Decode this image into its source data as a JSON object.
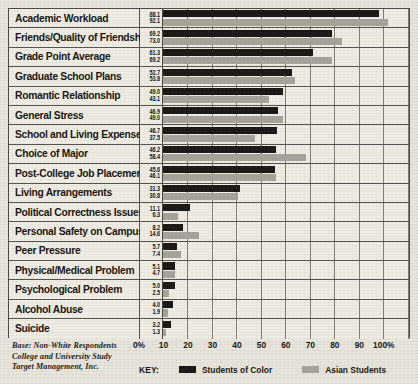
{
  "chart_data": {
    "type": "bar",
    "orientation": "horizontal",
    "title": "",
    "xlabel": "",
    "ylabel": "",
    "xlim": [
      0,
      100
    ],
    "grid": true,
    "legend_position": "bottom",
    "categories": [
      "Academic Workload",
      "Friends/Quality of Friendships",
      "Grade Point Average",
      "Graduate School Plans",
      "Romantic Relationship",
      "General Stress",
      "School and Living Expenses",
      "Choice of Major",
      "Post-College Job Placement",
      "Living Arrangements",
      "Political Correctness Issues",
      "Personal Safety on Campus",
      "Peer Pressure",
      "Physical/Medical Problem",
      "Psychological Problem",
      "Alcohol Abuse",
      "Suicide"
    ],
    "series": [
      {
        "name": "Students of Color",
        "color": "#1a1814",
        "values": [
          88.1,
          69.2,
          61.3,
          52.7,
          49.0,
          46.9,
          46.7,
          46.2,
          45.6,
          31.3,
          11.1,
          8.2,
          5.7,
          5.1,
          5.0,
          4.0,
          3.2
        ]
      },
      {
        "name": "Asian Students",
        "color": "#a6a39b",
        "values": [
          92.1,
          73.0,
          69.2,
          53.8,
          43.1,
          49.0,
          37.5,
          58.4,
          46.1,
          30.8,
          6.3,
          14.6,
          7.4,
          4.7,
          2.5,
          1.9,
          1.3
        ]
      }
    ],
    "xticks": [
      "0%",
      "10",
      "20",
      "30",
      "40",
      "50",
      "60",
      "70",
      "80",
      "90",
      "100%"
    ],
    "xtick_values": [
      0,
      10,
      20,
      30,
      40,
      50,
      60,
      70,
      80,
      90,
      100
    ]
  },
  "footnote": {
    "line1": "Base: Non-White Respondents",
    "line2": "College and University Study",
    "line3": "Target Management, Inc."
  },
  "legend": {
    "key_label": "KEY:",
    "items": [
      {
        "label": "Students of Color",
        "color": "#1a1814"
      },
      {
        "label": "Asian Students",
        "color": "#a6a39b"
      }
    ]
  }
}
